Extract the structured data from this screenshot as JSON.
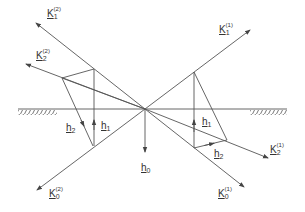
{
  "diagram": {
    "title": "",
    "labels": {
      "K1_2": {
        "base": "K",
        "sub": "1",
        "sup": "(2)"
      },
      "K2_2": {
        "base": "K",
        "sub": "2",
        "sup": "(2)"
      },
      "K0_2": {
        "base": "K",
        "sub": "0",
        "sup": "(2)"
      },
      "K1_1": {
        "base": "K",
        "sub": "1",
        "sup": "(1)"
      },
      "K2_1": {
        "base": "K",
        "sub": "2",
        "sup": "(1)"
      },
      "K0_1": {
        "base": "K",
        "sub": "0",
        "sup": "(1)"
      },
      "h0": {
        "base": "h",
        "sub": "0"
      },
      "h1_left": {
        "base": "h",
        "sub": "1"
      },
      "h2_left": {
        "base": "h",
        "sub": "2"
      },
      "h1_right": {
        "base": "h",
        "sub": "1"
      },
      "h2_right": {
        "base": "h",
        "sub": "2"
      }
    },
    "colors": {
      "line": "#555555",
      "text": "#333333"
    }
  }
}
